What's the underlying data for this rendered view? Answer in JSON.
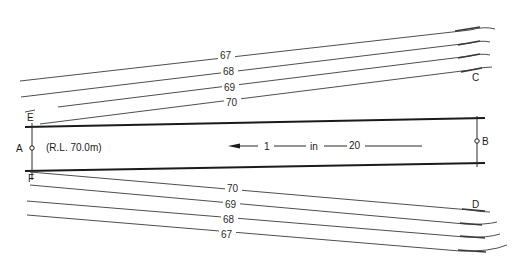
{
  "diagram": {
    "points": {
      "A": "A",
      "B": "B",
      "C": "C",
      "D": "D",
      "E": "E",
      "F": "F"
    },
    "reduced_level": "(R.L.  70.0m)",
    "gradient": {
      "rise": "1",
      "word": "in",
      "run": "20",
      "direction": "left"
    },
    "contours_top": [
      {
        "label": "67"
      },
      {
        "label": "68"
      },
      {
        "label": "69"
      },
      {
        "label": "70"
      }
    ],
    "contours_bottom": [
      {
        "label": "70"
      },
      {
        "label": "69"
      },
      {
        "label": "68"
      },
      {
        "label": "67"
      }
    ],
    "colors": {
      "line": "#1a1a1a",
      "contour": "#3a3a3a",
      "background": "#ffffff"
    }
  }
}
